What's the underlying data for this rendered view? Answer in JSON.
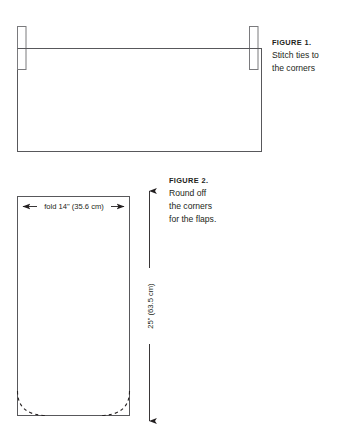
{
  "page": {
    "background": "#ffffff",
    "ink": "#231f20",
    "line_color": "#58585b"
  },
  "figures": [
    {
      "id": "figure-1",
      "caption": {
        "label": "FIGURE 1.",
        "lines": [
          "Stitch ties to",
          "the corners"
        ]
      },
      "diagram": {
        "type": "rectangle-with-ties",
        "description": "Wide rectangle representing a fabric panel with two narrow vertical tie strips crossing the upper edge near each corner",
        "shapes": [
          {
            "name": "fabric-panel",
            "type": "rect",
            "x": 17,
            "y": 48,
            "width": 245,
            "height": 104
          },
          {
            "name": "tie-left",
            "type": "rect",
            "x": 17,
            "y": 26,
            "width": 9,
            "height": 44
          },
          {
            "name": "tie-right",
            "type": "rect",
            "x": 249,
            "y": 26,
            "width": 9,
            "height": 44
          }
        ]
      }
    },
    {
      "id": "figure-2",
      "caption": {
        "label": "FIGURE 2.",
        "lines": [
          "Round off",
          "the corners",
          "for the flaps."
        ]
      },
      "diagram": {
        "type": "rectangle-with-rounded-corner-guides",
        "description": "Tall rectangle with dashed quarter-arcs at both bottom corners and two dimension arrows",
        "shapes": [
          {
            "name": "panel",
            "type": "rect",
            "x": 17,
            "y": 196,
            "width": 113,
            "height": 220
          },
          {
            "name": "corner-guide-left",
            "type": "dashed-arc"
          },
          {
            "name": "corner-guide-right",
            "type": "dashed-arc"
          }
        ],
        "dimensions": [
          {
            "name": "width-dimension",
            "orientation": "horizontal",
            "label": "fold 14\" (35.6 cm)",
            "arrows": "both"
          },
          {
            "name": "height-dimension",
            "orientation": "vertical",
            "label": "25\" (63.5 cm)",
            "arrows": "both"
          }
        ]
      }
    }
  ]
}
